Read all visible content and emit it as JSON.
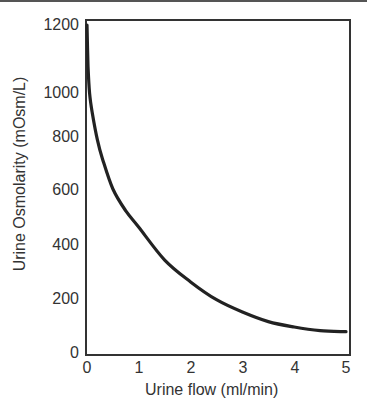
{
  "chart_data": {
    "type": "line",
    "title": "",
    "xlabel": "Urine flow (ml/min)",
    "ylabel": "Urine Osmolarity (mOsm/L)",
    "xlim": [
      0,
      5
    ],
    "ylim": [
      0,
      1200
    ],
    "x_ticks": [
      "0",
      "1",
      "2",
      "3",
      "4",
      "5"
    ],
    "y_ticks": [
      "0",
      "200",
      "400",
      "600",
      "800",
      "1000",
      "1200"
    ],
    "grid": false,
    "legend": null,
    "series": [
      {
        "name": "Urine osmolarity",
        "color": "#222222",
        "x": [
          0.0,
          0.02,
          0.05,
          0.1,
          0.2,
          0.3,
          0.5,
          0.75,
          1.0,
          1.5,
          2.0,
          2.5,
          3.0,
          3.5,
          4.0,
          4.5,
          5.0
        ],
        "y": [
          1200,
          1050,
          950,
          880,
          780,
          710,
          600,
          520,
          460,
          340,
          260,
          195,
          150,
          115,
          95,
          82,
          78
        ]
      }
    ]
  }
}
